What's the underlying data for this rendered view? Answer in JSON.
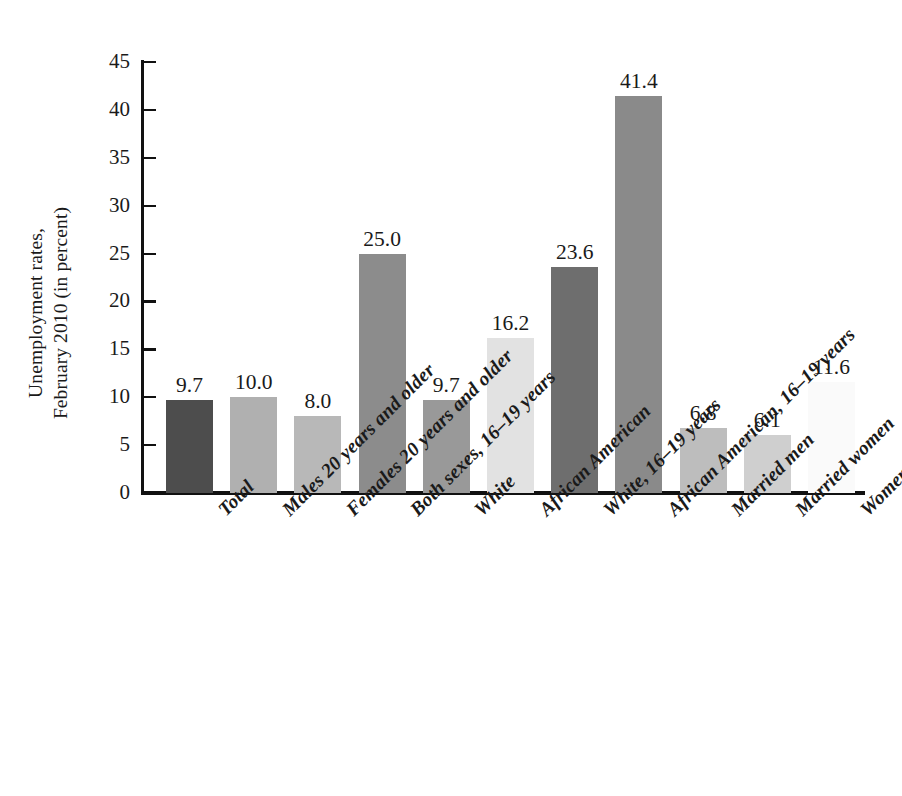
{
  "chart_data": {
    "type": "bar",
    "title": "",
    "subtitle": "",
    "xlabel": "",
    "ylabel": "Unemployment rates, February 2010 (in percent)",
    "ylabel_lines": [
      "Unemployment rates,",
      "February 2010 (in percent)"
    ],
    "ylim": [
      0,
      45
    ],
    "ytick_step": 5,
    "yticks": [
      0,
      5,
      10,
      15,
      20,
      25,
      30,
      35,
      40,
      45
    ],
    "ytick_labels": [
      "0",
      "5",
      "10",
      "15",
      "20",
      "25",
      "30",
      "35",
      "40",
      "45"
    ],
    "grid": false,
    "legend": null,
    "legend_position": "none",
    "value_labels_shown": true,
    "categories": [
      "Total",
      "Males 20 years and older",
      "Females 20 years and older",
      "Both sexes, 16–19 years",
      "White",
      "African American",
      "White, 16–19 years",
      "African American, 16–19 years",
      "Married men",
      "Married women",
      "Women maintaining families"
    ],
    "values": [
      9.7,
      10.0,
      8.0,
      25.0,
      9.7,
      16.2,
      23.6,
      41.4,
      6.8,
      6.1,
      11.6
    ],
    "value_labels": [
      "9.7",
      "10.0",
      "8.0",
      "25.0",
      "9.7",
      "16.2",
      "23.6",
      "41.4",
      "6.8",
      "6.1",
      "11.6"
    ],
    "bar_colors": [
      "#4d4d4d",
      "#b0b0b0",
      "#b8b8b8",
      "#8c8c8c",
      "#999999",
      "#e2e2e2",
      "#6e6e6e",
      "#8a8a8a",
      "#bdbdbd",
      "#cfcfcf",
      "#fafafa"
    ],
    "axis_color": "#111111",
    "background_color": "#ffffff"
  }
}
